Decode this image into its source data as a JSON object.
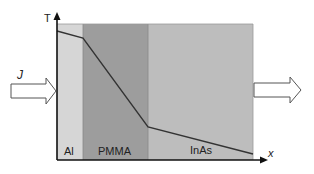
{
  "diagram": {
    "axes": {
      "y_label": "T",
      "x_label": "x"
    },
    "flux_label": "J",
    "layers": [
      {
        "name": "Al",
        "color": "#d6d6d6",
        "x0": 57,
        "x1": 83
      },
      {
        "name": "PMMA",
        "color": "#9d9d9d",
        "x0": 83,
        "x1": 148
      },
      {
        "name": "InAs",
        "color": "#bdbdbd",
        "x0": 148,
        "x1": 253
      }
    ],
    "temperature_profile": [
      {
        "x": 57,
        "y": 31
      },
      {
        "x": 83,
        "y": 38
      },
      {
        "x": 148,
        "y": 127
      },
      {
        "x": 253,
        "y": 154
      }
    ],
    "arrows": {
      "incoming": "heat-flux-in",
      "outgoing": "heat-flux-out"
    }
  }
}
